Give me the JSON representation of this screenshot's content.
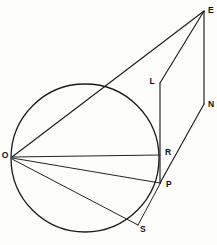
{
  "figure": {
    "type": "geometry-diagram",
    "background_color": "#fdfdfb",
    "stroke_color": "#1c1c1c",
    "label_color": "#111111",
    "canvas": {
      "width": 217,
      "height": 245
    },
    "circle": {
      "cx": 85,
      "cy": 158,
      "r": 74
    },
    "points": [
      {
        "name": "E",
        "label": "E",
        "x": 204,
        "y": 11,
        "label_x": 208,
        "label_y": 9
      },
      {
        "name": "L",
        "label": "L",
        "x": 160,
        "y": 83,
        "label_x": 152,
        "label_y": 81
      },
      {
        "name": "N",
        "label": "N",
        "x": 204,
        "y": 104,
        "label_x": 207,
        "label_y": 104
      },
      {
        "name": "R",
        "label": "R",
        "x": 160,
        "y": 155,
        "label_x": 164,
        "label_y": 153
      },
      {
        "name": "P",
        "label": "P",
        "x": 160,
        "y": 183,
        "label_x": 165,
        "label_y": 184
      },
      {
        "name": "O",
        "label": "O",
        "x": 12,
        "y": 157,
        "label_x": 3,
        "label_y": 156
      },
      {
        "name": "S",
        "label": "S",
        "x": 134,
        "y": 222,
        "label_x": 138,
        "label_y": 228
      }
    ],
    "segments": [
      {
        "name": "segment-O-E",
        "from": "O",
        "to": "E"
      },
      {
        "name": "segment-E-L",
        "from": "E",
        "to": "L"
      },
      {
        "name": "segment-E-N",
        "from": "E",
        "to": "N"
      },
      {
        "name": "segment-L-P",
        "from": "L",
        "to": "P"
      },
      {
        "name": "segment-N-P",
        "from": "N",
        "to": "P"
      },
      {
        "name": "segment-O-R",
        "from": "O",
        "to": "R"
      },
      {
        "name": "segment-O-P",
        "from": "O",
        "to": "P"
      },
      {
        "name": "segment-O-S",
        "from": "O",
        "to": "S"
      },
      {
        "name": "segment-S-P",
        "from": "S",
        "to": "P"
      }
    ]
  }
}
